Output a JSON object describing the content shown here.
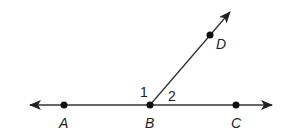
{
  "diagram": {
    "type": "geometry-angles",
    "colors": {
      "stroke": "#333333",
      "point": "#111111",
      "background": "#ffffff"
    },
    "line": {
      "name": "line AC",
      "through": [
        "A",
        "B",
        "C"
      ]
    },
    "ray": {
      "name": "ray BD",
      "from": "B",
      "through": "D"
    },
    "points": [
      {
        "name": "A",
        "label": "A"
      },
      {
        "name": "B",
        "label": "B"
      },
      {
        "name": "C",
        "label": "C"
      },
      {
        "name": "D",
        "label": "D"
      }
    ],
    "angles": [
      {
        "label": "1",
        "between": [
          "BA",
          "BD"
        ]
      },
      {
        "label": "2",
        "between": [
          "BD",
          "BC"
        ]
      }
    ]
  }
}
